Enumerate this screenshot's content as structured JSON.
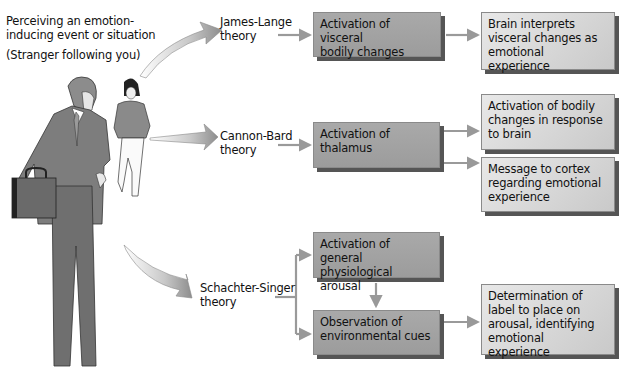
{
  "stimulus": {
    "line1": "Perceiving an emotion-",
    "line2": "inducing event or situation",
    "example": "(Stranger following you)"
  },
  "theories": [
    {
      "name_line1": "James-Lange",
      "name_line2": "theory",
      "boxes": [
        {
          "lines": [
            "Activation of visceral",
            "bodily changes"
          ]
        },
        {
          "lines": [
            "Brain interprets",
            "visceral changes as",
            "emotional experience"
          ]
        }
      ]
    },
    {
      "name_line1": "Cannon-Bard",
      "name_line2": "theory",
      "boxes": [
        {
          "lines": [
            "Activation of",
            "thalamus"
          ]
        },
        {
          "lines": [
            "Activation of bodily",
            "changes in response",
            "to brain"
          ]
        },
        {
          "lines": [
            "Message to cortex",
            "regarding emotional",
            "experience"
          ]
        }
      ]
    },
    {
      "name_line1": "Schachter-Singer",
      "name_line2": "theory",
      "boxes": [
        {
          "lines": [
            "Activation of general",
            "physiological arousal"
          ]
        },
        {
          "lines": [
            "Observation of",
            "environmental cues"
          ]
        },
        {
          "lines": [
            "Determination of",
            "label to place on",
            "arousal, identifying",
            "emotional experience"
          ]
        }
      ]
    }
  ],
  "colors": {
    "box_dark": "#a3a3a3",
    "box_light": "#d8d8d8",
    "arrow": "#9a9a9a",
    "shadow": "#555555",
    "suit": "#7a7a7a"
  }
}
